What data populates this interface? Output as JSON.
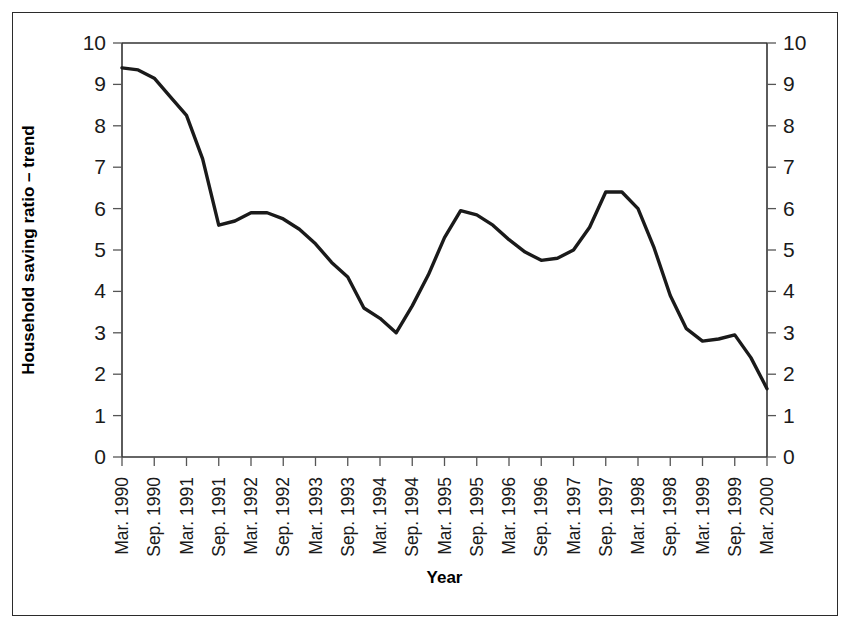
{
  "figure": {
    "background_color": "#ffffff",
    "frame_color": "#2b2b2b",
    "line_color": "#1a1a1a"
  },
  "chart_data": {
    "type": "line",
    "title": "",
    "xlabel": "Year",
    "ylabel": "Household saving ratio – trend",
    "y2label": "",
    "ylim": [
      0,
      10
    ],
    "y2lim": [
      0,
      10
    ],
    "grid": false,
    "legend": null,
    "yticks": [
      0,
      1,
      2,
      3,
      4,
      5,
      6,
      7,
      8,
      9,
      10
    ],
    "ytick_labels": [
      "0",
      "1",
      "2",
      "3",
      "4",
      "5",
      "6",
      "7",
      "8",
      "9",
      "10"
    ],
    "y2tick_labels": [
      "0",
      "1",
      "2",
      "3",
      "4",
      "5",
      "6",
      "7",
      "8",
      "9",
      "10"
    ],
    "categories": [
      "Mar. 1990",
      "Sep. 1990",
      "Mar. 1991",
      "Sep. 1991",
      "Mar. 1992",
      "Sep. 1992",
      "Mar. 1993",
      "Sep. 1993",
      "Mar. 1994",
      "Sep. 1994",
      "Mar. 1995",
      "Sep. 1995",
      "Mar. 1996",
      "Sep. 1996",
      "Mar. 1997",
      "Sep. 1997",
      "Mar. 1998",
      "Sep. 1998",
      "Mar. 1999",
      "Sep. 1999",
      "Mar. 2000"
    ],
    "series": [
      {
        "name": "Household saving ratio – trend",
        "values": [
          9.4,
          8.25,
          5.6,
          5.9,
          5.75,
          5.15,
          4.35,
          3.0,
          4.4,
          5.95,
          5.6,
          4.95,
          4.75,
          5.5,
          6.4,
          5.05,
          2.8,
          2.85,
          2.95,
          2.4,
          1.65
        ],
        "dense_x": [
          1990.0,
          1990.25,
          1990.5,
          1990.75,
          1991.0,
          1991.25,
          1991.5,
          1991.75,
          1992.0,
          1992.25,
          1992.5,
          1992.75,
          1993.0,
          1993.25,
          1993.5,
          1993.75,
          1994.0,
          1994.25,
          1994.5,
          1994.75,
          1995.0,
          1995.25,
          1995.5,
          1995.75,
          1996.0,
          1996.25,
          1996.5,
          1996.75,
          1997.0,
          1997.25,
          1997.5,
          1997.75,
          1998.0,
          1998.25,
          1998.5,
          1998.75,
          1999.0,
          1999.25,
          1999.5,
          1999.75,
          2000.0
        ],
        "dense_y": [
          9.4,
          9.35,
          9.15,
          8.7,
          8.25,
          7.2,
          5.6,
          5.7,
          5.9,
          5.9,
          5.75,
          5.5,
          5.15,
          4.7,
          4.35,
          3.6,
          3.35,
          3.0,
          3.65,
          4.4,
          5.3,
          5.95,
          5.85,
          5.6,
          5.25,
          4.95,
          4.75,
          4.8,
          5.0,
          5.55,
          6.4,
          6.4,
          6.0,
          5.05,
          3.9,
          3.1,
          2.8,
          2.85,
          2.95,
          2.4,
          1.65
        ]
      }
    ]
  }
}
